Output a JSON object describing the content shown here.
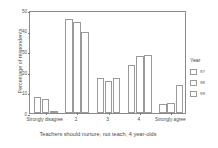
{
  "chart_data": {
    "type": "bar",
    "title": "",
    "xlabel": "Teachers should nurture, not teach, 4 year-olds",
    "ylabel": "Percentage of respondents",
    "categories": [
      "Strongly disagree",
      "2",
      "3",
      "4",
      "Strongly agree"
    ],
    "series": [
      {
        "name": "97",
        "values": [
          7.8,
          45.5,
          17.0,
          23.5,
          4.5
        ]
      },
      {
        "name": "98",
        "values": [
          6.8,
          44.0,
          15.5,
          27.5,
          4.8
        ]
      },
      {
        "name": "99",
        "values": [
          1.2,
          39.3,
          17.0,
          28.0,
          13.5
        ]
      }
    ],
    "ylim": [
      0,
      50
    ],
    "yticks": [
      0,
      10,
      20,
      30,
      40,
      50
    ],
    "ytick_labels": [
      "0",
      "10",
      "20",
      "30",
      "40",
      "50"
    ],
    "grid": false,
    "legend": {
      "title": "Year",
      "position": "right",
      "entries": [
        "97",
        "98",
        "99"
      ]
    },
    "bar_fill": "#ffffff",
    "bar_edge": "#9a9a9a",
    "axis_color": "#8a8a8a",
    "text_color": "#4a4a4a",
    "background": "#ffffff"
  }
}
